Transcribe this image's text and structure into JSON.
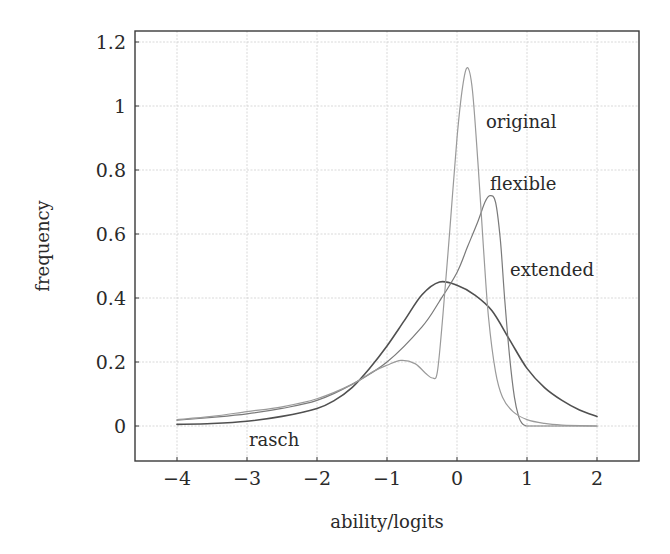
{
  "chart_data": {
    "type": "line",
    "title": "",
    "xlabel": "ability/logits",
    "ylabel": "frequency",
    "xlim": [
      -4.6,
      2.6
    ],
    "ylim": [
      -0.11,
      1.3
    ],
    "x_ticks": [
      -4,
      -3,
      -2,
      -1,
      0,
      1,
      2
    ],
    "x_tick_labels": [
      "−4",
      "−3",
      "−2",
      "−1",
      "0",
      "1",
      "2"
    ],
    "y_ticks": [
      0,
      0.2,
      0.4,
      0.6,
      0.8,
      1,
      1.2
    ],
    "y_tick_labels": [
      "0",
      "0.2",
      "0.4",
      "0.6",
      "0.8",
      "1",
      "1.2"
    ],
    "grid": true,
    "legend": "inline labels next to curves",
    "series": [
      {
        "name": "rasch",
        "color": "#505050",
        "width": 1.6,
        "label_pos": [
          -2.99,
          -0.045
        ],
        "x": [
          -4,
          -3.5,
          -3,
          -2.5,
          -2,
          -1.75,
          -1.5,
          -1.25,
          -1,
          -0.75,
          -0.5,
          -0.25,
          0,
          0.25,
          0.5,
          0.75,
          1,
          1.25,
          1.5,
          1.75,
          2
        ],
        "y": [
          0.005,
          0.008,
          0.015,
          0.03,
          0.055,
          0.08,
          0.12,
          0.18,
          0.25,
          0.33,
          0.41,
          0.45,
          0.44,
          0.41,
          0.36,
          0.27,
          0.18,
          0.12,
          0.08,
          0.05,
          0.03
        ]
      },
      {
        "name": "flexible",
        "color": "#7a7a7a",
        "width": 1.2,
        "label_pos": [
          0.47,
          0.74
        ],
        "x": [
          -4,
          -3.5,
          -3,
          -2.5,
          -2,
          -1.5,
          -1,
          -0.5,
          -0.25,
          0,
          0.15,
          0.3,
          0.4,
          0.47,
          0.55,
          0.62,
          0.68,
          0.75,
          0.82,
          0.88,
          0.93,
          0.97,
          1.05,
          1.5,
          2
        ],
        "y": [
          0.018,
          0.027,
          0.038,
          0.055,
          0.08,
          0.13,
          0.2,
          0.31,
          0.39,
          0.48,
          0.56,
          0.64,
          0.7,
          0.72,
          0.7,
          0.58,
          0.4,
          0.22,
          0.09,
          0.03,
          0.008,
          0.002,
          0.0,
          0.0,
          0.0
        ]
      },
      {
        "name": "original",
        "color": "#9a9a9a",
        "width": 1.2,
        "label_pos": [
          0.41,
          0.94
        ],
        "x": [
          -4,
          -3.5,
          -3,
          -2.5,
          -2,
          -1.5,
          -1.2,
          -1,
          -0.8,
          -0.6,
          -0.45,
          -0.35,
          -0.28,
          -0.2,
          -0.1,
          0,
          0.08,
          0.15,
          0.22,
          0.3,
          0.38,
          0.45,
          0.55,
          0.65,
          0.8,
          1,
          1.25,
          1.5,
          2
        ],
        "y": [
          0.02,
          0.03,
          0.045,
          0.06,
          0.085,
          0.13,
          0.17,
          0.19,
          0.205,
          0.195,
          0.165,
          0.15,
          0.17,
          0.35,
          0.62,
          0.9,
          1.06,
          1.12,
          1.05,
          0.82,
          0.55,
          0.34,
          0.17,
          0.09,
          0.045,
          0.02,
          0.008,
          0.003,
          0.0
        ]
      }
    ],
    "annotations": [
      {
        "text": "original",
        "x": 0.41,
        "y": 0.94
      },
      {
        "text": "flexible",
        "x": 0.47,
        "y": 0.75
      },
      {
        "text": "extended",
        "x": 0.75,
        "y": 0.48
      },
      {
        "text": "rasch",
        "x": -2.99,
        "y": -0.045
      }
    ]
  },
  "labels": {
    "xlabel": "ability/logits",
    "ylabel": "frequency",
    "original": "original",
    "flexible": "flexible",
    "extended": "extended",
    "rasch": "rasch"
  }
}
